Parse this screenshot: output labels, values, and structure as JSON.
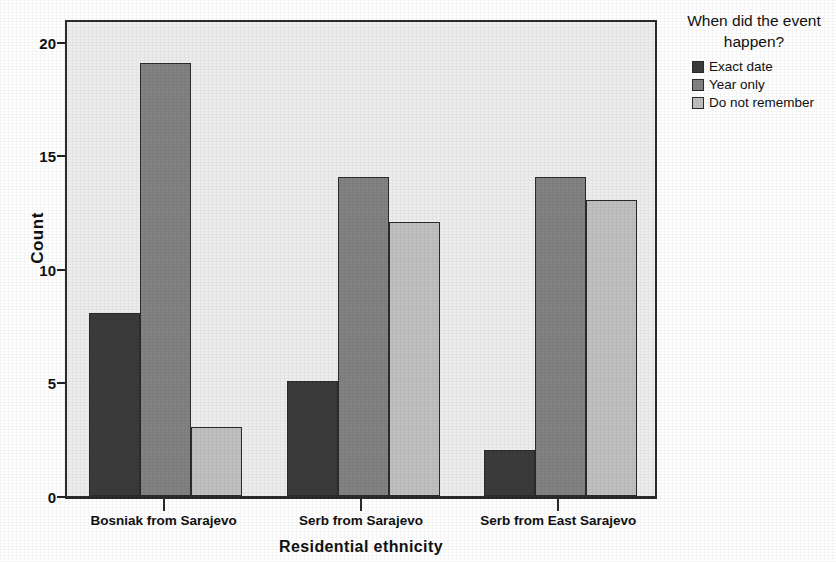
{
  "chart_data": {
    "type": "bar",
    "title": "",
    "xlabel": "Residential ethnicity",
    "ylabel": "Count",
    "categories": [
      "Bosniak from Sarajevo",
      "Serb from Sarajevo",
      "Serb from East Sarajevo"
    ],
    "series": [
      {
        "name": "Exact date",
        "values": [
          8,
          5,
          2
        ],
        "color": "#3b3b3b"
      },
      {
        "name": "Year only",
        "values": [
          19,
          14,
          14
        ],
        "color": "#828282"
      },
      {
        "name": "Do not remember",
        "values": [
          3,
          12,
          13
        ],
        "color": "#c0c0c0"
      }
    ],
    "ylim": [
      0,
      21
    ],
    "yticks": [
      0,
      5,
      10,
      15,
      20
    ],
    "ytick_labels": [
      "0",
      "5",
      "10",
      "15",
      "20"
    ],
    "grid": false,
    "legend_position": "right",
    "legend_title": "When did the event happen?",
    "plot_background": "#ededed",
    "axis_color": "#2b2b2b"
  },
  "legend": {
    "title_line1": "When did the event",
    "title_line2": "happen?",
    "entries": [
      "Exact date",
      "Year only",
      "Do not remember"
    ]
  },
  "axes": {
    "y_title": "Count",
    "x_title": "Residential ethnicity"
  }
}
